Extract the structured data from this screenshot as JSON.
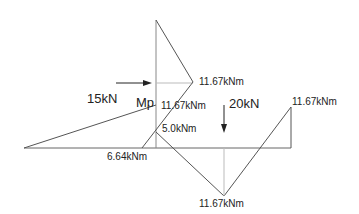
{
  "diagram": {
    "type": "bending-moment-diagram",
    "loads": {
      "horizontal": "15kN",
      "vertical": "20kN"
    },
    "point_label": "Mp",
    "moments": {
      "column_joint": "11.67kNm",
      "column_base_top": "11.67kNm",
      "column_mid": "5.0kNm",
      "beam_left": "6.64kNm",
      "beam_midspan": "11.67kNm",
      "beam_right_end": "11.67kNm"
    },
    "colors": {
      "line": "#555555",
      "guide": "#bbbbbb",
      "text": "#222222"
    }
  }
}
